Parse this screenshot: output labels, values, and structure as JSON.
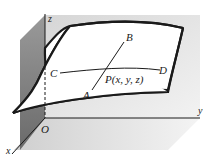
{
  "figure": {
    "axes": {
      "x_label": "x",
      "y_label": "y",
      "z_label": "z",
      "origin_label": "O"
    },
    "points": {
      "A": "A",
      "B": "B",
      "C": "C",
      "D": "D",
      "P": "P(x, y, z)"
    },
    "colors": {
      "ink": "#1a1a1a",
      "wall_dark": "#7a7a7a",
      "wall_mid": "#a8a8a8",
      "floor": "#d8d8d8",
      "back": "#e6e6e6",
      "surface": "#ffffff"
    }
  }
}
